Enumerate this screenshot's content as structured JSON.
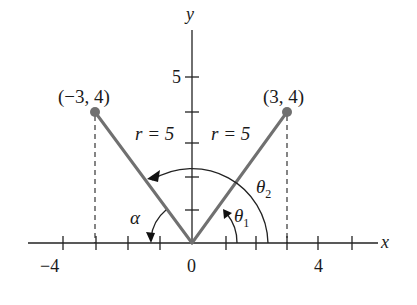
{
  "axes": {
    "x_label": "x",
    "y_label": "y",
    "x_tick_labels": [
      {
        "value": -4,
        "text": "−4"
      },
      {
        "value": 0,
        "text": "0"
      },
      {
        "value": 4,
        "text": "4"
      }
    ],
    "y_tick_labels": [
      {
        "value": 5,
        "text": "5"
      }
    ],
    "x_range": [
      -5,
      6
    ],
    "y_range": [
      0,
      6
    ]
  },
  "points": [
    {
      "label": "(−3, 4)",
      "x": -3,
      "y": 4
    },
    {
      "label": "(3, 4)",
      "x": 3,
      "y": 4
    }
  ],
  "segments": [
    {
      "label": "r = 5",
      "from": [
        0,
        0
      ],
      "to": [
        -3,
        4
      ]
    },
    {
      "label": "r = 5",
      "from": [
        0,
        0
      ],
      "to": [
        3,
        4
      ]
    }
  ],
  "angles": {
    "alpha": "α",
    "theta1": "θ",
    "theta1_sub": "1",
    "theta2": "θ",
    "theta2_sub": "2"
  },
  "colors": {
    "ray": "#707070",
    "axis": "#222222",
    "background": "#ffffff"
  }
}
